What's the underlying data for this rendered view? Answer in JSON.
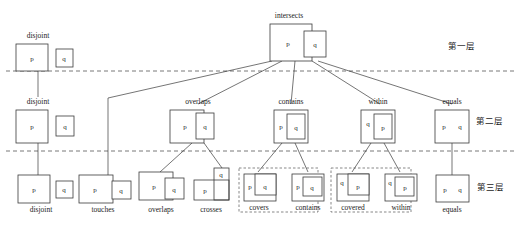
{
  "diagram": {
    "layers": [
      {
        "id": "layer1",
        "label": "第一层"
      },
      {
        "id": "layer2",
        "label": "第二层"
      },
      {
        "id": "layer3",
        "label": "第三层"
      }
    ],
    "glyphs": {
      "p": "p",
      "q": "q"
    },
    "nodes": {
      "intersects": {
        "label": "intersects",
        "layer": 1
      },
      "disjoint_l2": {
        "label": "disjoint",
        "layer": 2
      },
      "overlaps_l2": {
        "label": "overlaps",
        "layer": 2
      },
      "contains_l2": {
        "label": "contains",
        "layer": 2
      },
      "within_l2": {
        "label": "within",
        "layer": 2
      },
      "equals_l2": {
        "label": "equals",
        "layer": 2
      },
      "disjoint_l3": {
        "label": "disjoint",
        "layer": 3
      },
      "touches_l3": {
        "label": "touches",
        "layer": 3
      },
      "overlaps_l3": {
        "label": "overlaps",
        "layer": 3
      },
      "crosses_l3": {
        "label": "crosses",
        "layer": 3
      },
      "covers_l3": {
        "label": "covers",
        "layer": 3
      },
      "contains_l3": {
        "label": "contains",
        "layer": 3
      },
      "covered_l3": {
        "label": "covered",
        "layer": 3
      },
      "within_l3": {
        "label": "within",
        "layer": 3
      },
      "equals_l3": {
        "label": "equals",
        "layer": 3
      }
    },
    "colors": {
      "stroke": "#3a3a3a",
      "separator": "#555555",
      "group": "#555555",
      "background": "#ffffff"
    }
  }
}
